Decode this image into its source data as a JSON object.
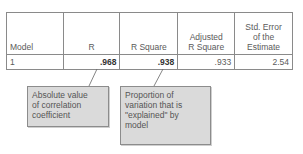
{
  "table": {
    "headers": {
      "model": "Model",
      "r": "R",
      "r_square": "R Square",
      "adjusted_r_square_line1": "Adjusted",
      "adjusted_r_square_line2": "R Square",
      "std_error_line1": "Std. Error",
      "std_error_line2": "of the",
      "std_error_line3": "Estimate"
    },
    "rows": [
      {
        "model": "1",
        "r": ".968",
        "r_square": ".938",
        "adjusted_r_square": ".933",
        "std_error": "2.54"
      }
    ]
  },
  "callouts": [
    {
      "target": "R",
      "lines": [
        "Absolute value",
        "of correlation",
        "coefficient"
      ]
    },
    {
      "target": "R Square",
      "lines": [
        "Proportion of",
        "variation that is",
        "\"explained\" by",
        "model"
      ]
    }
  ],
  "colors": {
    "border": "#8a8a8a",
    "callout_fill": "#dadada",
    "text": "#5a5a5a"
  }
}
